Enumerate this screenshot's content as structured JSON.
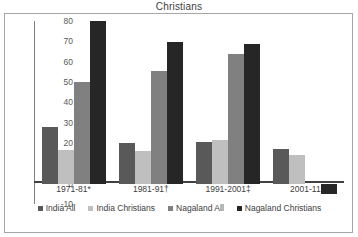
{
  "chart_data": {
    "type": "bar",
    "title": "Christians",
    "xlabel": "",
    "ylabel": "",
    "ylim": [
      -10,
      80
    ],
    "yticks": [
      "80",
      "70",
      "60",
      "50",
      "40",
      "30",
      "20",
      "10",
      "0",
      "-10"
    ],
    "grid": false,
    "legend_position": "bottom",
    "categories": [
      "1971-81*",
      "1981-91†",
      "1991-2001‡",
      "2001-11"
    ],
    "series": [
      {
        "name": "India All",
        "color": "#595959",
        "values": [
          28.0,
          20.0,
          20.5,
          17.0
        ]
      },
      {
        "name": "India Christians",
        "color": "#bfbfbf",
        "values": [
          16.5,
          16.0,
          21.5,
          14.0
        ]
      },
      {
        "name": "Nagaland All",
        "color": "#808080",
        "values": [
          50.0,
          55.5,
          64.0,
          0.0
        ]
      },
      {
        "name": "Nagaland Christians",
        "color": "#262626",
        "values": [
          80.0,
          69.5,
          68.5,
          -5.0
        ]
      }
    ]
  }
}
